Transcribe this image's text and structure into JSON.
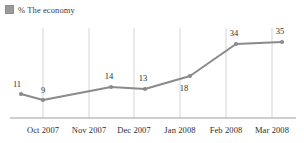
{
  "legend": {
    "swatch_color": "#9a9a9a",
    "label": "% The economy"
  },
  "chart_data": {
    "type": "line",
    "title": "",
    "subtitle": "",
    "xlabel": "",
    "ylabel": "",
    "categories": [
      "",
      "Oct 2007",
      "Nov 2007",
      "Dec 2007",
      "Jan 2008",
      "Feb 2008",
      "Mar 2008"
    ],
    "tick_labels": [
      "Oct 2007",
      "Nov 2007",
      "Dec 2007",
      "Jan 2008",
      "Feb 2008",
      "Mar 2008"
    ],
    "values": [
      11,
      9,
      14,
      13,
      18,
      34,
      35
    ],
    "data_labels": [
      "11",
      "9",
      "14",
      "13",
      "18",
      "34",
      "35"
    ],
    "series": [
      {
        "name": "% The economy",
        "values": [
          11,
          9,
          14,
          13,
          18,
          34,
          35
        ],
        "color": "#8a8a8a"
      }
    ],
    "ylim": [
      0,
      40
    ],
    "grid": "vertical",
    "legend_position": "top-left",
    "line_color": "#8a8a8a",
    "marker_color": "#8a8a8a",
    "axis_color": "#9e9e9e",
    "gridline_color": "#d5d5d5"
  },
  "points": [
    {
      "label": "11",
      "px": 21,
      "py": 94,
      "lx": 17,
      "ly": 84
    },
    {
      "label": "9",
      "px": 43,
      "py": 100,
      "lx": 43,
      "ly": 90
    },
    {
      "label": "14",
      "px": 111,
      "py": 87,
      "lx": 109,
      "ly": 76
    },
    {
      "label": "13",
      "px": 145,
      "py": 89,
      "lx": 143,
      "ly": 78
    },
    {
      "label": "18",
      "px": 190,
      "py": 76,
      "lx": 184,
      "ly": 88
    },
    {
      "label": "34",
      "px": 236,
      "py": 44,
      "lx": 234,
      "ly": 33
    },
    {
      "label": "35",
      "px": 282,
      "py": 42,
      "lx": 280,
      "ly": 31
    }
  ],
  "gridlines_x": [
    43,
    89,
    134,
    180,
    226,
    272
  ],
  "xtick_positions": [
    43,
    89,
    134,
    180,
    226,
    272
  ],
  "axis": {
    "baseline_y": 118,
    "top_y": 28,
    "left_x": 10,
    "right_x": 296
  }
}
